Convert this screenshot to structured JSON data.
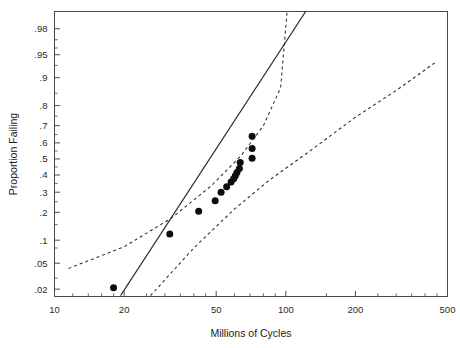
{
  "chart_data": {
    "type": "scatter",
    "title": "",
    "subtitle": "",
    "xlabel": "Millions of Cycles",
    "ylabel": "Proportion Failing",
    "xscale": "log",
    "yscale": "probability",
    "xlim": [
      10,
      500
    ],
    "ylim": [
      0.015,
      0.99
    ],
    "grid": false,
    "legend": null,
    "legend_position": "none",
    "x_ticks": [
      {
        "value": 10,
        "label": "10"
      },
      {
        "value": 20,
        "label": "20"
      },
      {
        "value": 50,
        "label": "50"
      },
      {
        "value": 100,
        "label": "100"
      },
      {
        "value": 200,
        "label": "200"
      },
      {
        "value": 500,
        "label": "500"
      }
    ],
    "x_minor_ticks": [
      12,
      14,
      16,
      18,
      25,
      30,
      35,
      40,
      45,
      60,
      70,
      80,
      90,
      150,
      250,
      300,
      350,
      400,
      450
    ],
    "y_ticks": [
      {
        "value": 0.98,
        "label": ".98"
      },
      {
        "value": 0.95,
        "label": ".95"
      },
      {
        "value": 0.9,
        "label": ".9"
      },
      {
        "value": 0.8,
        "label": ".8"
      },
      {
        "value": 0.7,
        "label": ".7"
      },
      {
        "value": 0.6,
        "label": ".6"
      },
      {
        "value": 0.5,
        "label": ".5"
      },
      {
        "value": 0.4,
        "label": ".4"
      },
      {
        "value": 0.3,
        "label": ".3"
      },
      {
        "value": 0.2,
        "label": ".2"
      },
      {
        "value": 0.1,
        "label": ".1"
      },
      {
        "value": 0.05,
        "label": ".05"
      },
      {
        "value": 0.02,
        "label": ".02"
      }
    ],
    "y_minor_ticks": [
      0.97,
      0.96,
      0.93,
      0.85,
      0.75,
      0.65,
      0.55,
      0.45,
      0.35,
      0.25,
      0.15,
      0.08,
      0.03
    ],
    "series": [
      {
        "name": "Observed failures",
        "type": "scatter",
        "marker": "filled-circle",
        "color": "#0d0d0d",
        "points": [
          {
            "x": 18.0,
            "y": 0.021
          },
          {
            "x": 31.5,
            "y": 0.118
          },
          {
            "x": 42.0,
            "y": 0.205
          },
          {
            "x": 49.5,
            "y": 0.255
          },
          {
            "x": 52.5,
            "y": 0.3
          },
          {
            "x": 55.5,
            "y": 0.33
          },
          {
            "x": 58.0,
            "y": 0.358
          },
          {
            "x": 59.5,
            "y": 0.378
          },
          {
            "x": 60.5,
            "y": 0.395
          },
          {
            "x": 61.5,
            "y": 0.415
          },
          {
            "x": 63.0,
            "y": 0.44
          },
          {
            "x": 63.5,
            "y": 0.478
          },
          {
            "x": 71.5,
            "y": 0.64
          },
          {
            "x": 71.5,
            "y": 0.565
          },
          {
            "x": 71.5,
            "y": 0.505
          }
        ]
      },
      {
        "name": "Fitted line",
        "type": "line",
        "style": "solid",
        "color": "#2b2b2b",
        "points": [
          {
            "x": 19.3,
            "y": 0.0155
          },
          {
            "x": 135.0,
            "y": 0.995
          }
        ]
      },
      {
        "name": "Upper confidence bound",
        "type": "line",
        "style": "dashed",
        "color": "#2b2b2b",
        "points": [
          {
            "x": 11.5,
            "y": 0.042
          },
          {
            "x": 20.0,
            "y": 0.083
          },
          {
            "x": 32.0,
            "y": 0.175
          },
          {
            "x": 48.0,
            "y": 0.34
          },
          {
            "x": 64.0,
            "y": 0.52
          },
          {
            "x": 80.0,
            "y": 0.7
          },
          {
            "x": 95.0,
            "y": 0.87
          },
          {
            "x": 102.0,
            "y": 0.993
          }
        ]
      },
      {
        "name": "Lower confidence bound",
        "type": "line",
        "style": "dashed",
        "color": "#2b2b2b",
        "points": [
          {
            "x": 26.0,
            "y": 0.0155
          },
          {
            "x": 40.0,
            "y": 0.08
          },
          {
            "x": 60.0,
            "y": 0.215
          },
          {
            "x": 85.0,
            "y": 0.37
          },
          {
            "x": 130.0,
            "y": 0.56
          },
          {
            "x": 200.0,
            "y": 0.745
          },
          {
            "x": 300.0,
            "y": 0.86
          },
          {
            "x": 440.0,
            "y": 0.935
          }
        ]
      }
    ]
  }
}
